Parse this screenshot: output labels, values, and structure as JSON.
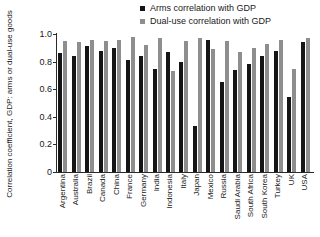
{
  "chart_data": {
    "type": "bar",
    "title": "",
    "xlabel": "",
    "ylabel": "Correlation coefficient, GDP: arms or dual-use goods",
    "ylim": [
      0,
      1.0
    ],
    "yticks": [
      "0",
      "0.2",
      "0.4",
      "0.6",
      "0.8",
      "1.0"
    ],
    "ytick_values": [
      0,
      0.2,
      0.4,
      0.6,
      0.8,
      1.0
    ],
    "grid": false,
    "legend_position": "top-right",
    "categories": [
      "Argentina",
      "Australia",
      "Brazil",
      "Canada",
      "China",
      "France",
      "Germany",
      "India",
      "Indonesia",
      "Italy",
      "Japan",
      "Mexico",
      "Russia",
      "Saudi Arabia",
      "South Africa",
      "South Korea",
      "Turkey",
      "UK",
      "USA"
    ],
    "series": [
      {
        "name": "Arms correlation with GDP",
        "color": "#151515",
        "values": [
          0.86,
          0.84,
          0.91,
          0.88,
          0.9,
          0.81,
          0.84,
          0.75,
          0.87,
          0.8,
          0.33,
          0.96,
          0.65,
          0.74,
          0.78,
          0.84,
          0.88,
          0.54,
          0.94
        ]
      },
      {
        "name": "Dual-use correlation with GDP",
        "color": "#8e8e8e",
        "values": [
          0.95,
          0.94,
          0.96,
          0.95,
          0.96,
          0.98,
          0.92,
          0.97,
          0.73,
          0.95,
          0.97,
          0.89,
          0.95,
          0.87,
          0.9,
          0.93,
          0.96,
          0.75,
          0.97
        ]
      }
    ]
  },
  "legend": {
    "items": [
      {
        "label": "Arms correlation with GDP"
      },
      {
        "label": "Dual-use correlation with GDP"
      }
    ]
  },
  "axes": {
    "y_title": "Correlation coefficient, GDP: arms or dual-use goods"
  }
}
